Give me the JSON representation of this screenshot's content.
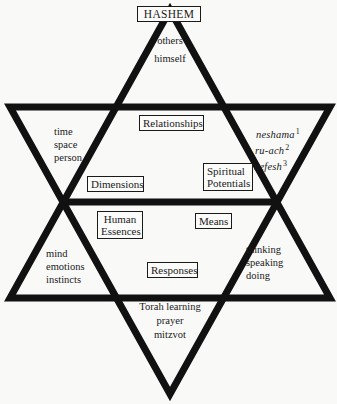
{
  "diagram": {
    "type": "six-pointed star (Star of David) concept diagram",
    "stroke_color": "#111111",
    "background_color": "#f9f9f8"
  },
  "segments": {
    "top": {
      "label": "HASHEM",
      "items": [
        "others",
        "himself"
      ],
      "section_label": "Relationships"
    },
    "upper_left": {
      "items": [
        "time",
        "space",
        "person"
      ],
      "section_label": "Dimensions"
    },
    "upper_right": {
      "items": [
        {
          "text": "neshama",
          "sup": "1"
        },
        {
          "text": "ru-ach",
          "sup": "2"
        },
        {
          "text": "nefesh",
          "sup": "3"
        }
      ],
      "section_label": [
        "Spiritual",
        "Potentials"
      ]
    },
    "lower_left": {
      "section_label": [
        "Human",
        "Essences"
      ],
      "items": [
        "mind",
        "emotions",
        "instincts"
      ]
    },
    "lower_right": {
      "section_label": "Means",
      "items": [
        "thinking",
        "speaking",
        "doing"
      ]
    },
    "bottom": {
      "section_label": "Responses",
      "items": [
        "Torah learning",
        "prayer",
        "mitzvot"
      ]
    }
  }
}
